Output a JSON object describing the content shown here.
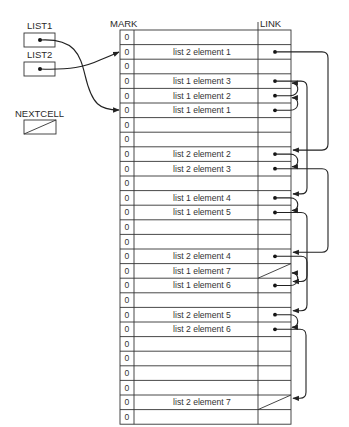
{
  "labels": {
    "list1": "LIST1",
    "list2": "LIST2",
    "nextcell": "NEXTCELL",
    "mark_header": "MARK",
    "link_header": "LINK"
  },
  "table": {
    "x": 120,
    "y": 30,
    "row_height": 14.6,
    "mark_col_right": 134,
    "link_col_left": 258,
    "right": 291,
    "rows": [
      {
        "mark": "0",
        "value": ""
      },
      {
        "mark": "0",
        "value": "list 2 element 1"
      },
      {
        "mark": "0",
        "value": ""
      },
      {
        "mark": "0",
        "value": "list 1 element 3"
      },
      {
        "mark": "0",
        "value": "list 1 element 2"
      },
      {
        "mark": "0",
        "value": "list 1 element 1"
      },
      {
        "mark": "0",
        "value": ""
      },
      {
        "mark": "0",
        "value": ""
      },
      {
        "mark": "0",
        "value": "list 2 element 2"
      },
      {
        "mark": "0",
        "value": "list 2 element 3"
      },
      {
        "mark": "0",
        "value": ""
      },
      {
        "mark": "0",
        "value": "list 1 element 4"
      },
      {
        "mark": "0",
        "value": "list 1 element 5"
      },
      {
        "mark": "0",
        "value": ""
      },
      {
        "mark": "0",
        "value": ""
      },
      {
        "mark": "0",
        "value": "list 2 element 4"
      },
      {
        "mark": "0",
        "value": "list 1 element 7"
      },
      {
        "mark": "0",
        "value": "list 1 element 6"
      },
      {
        "mark": "0",
        "value": ""
      },
      {
        "mark": "0",
        "value": "list 2 element 5"
      },
      {
        "mark": "0",
        "value": "list 2 element 6"
      },
      {
        "mark": "0",
        "value": ""
      },
      {
        "mark": "0",
        "value": ""
      },
      {
        "mark": "0",
        "value": ""
      },
      {
        "mark": "0",
        "value": ""
      },
      {
        "mark": "0",
        "value": "list 2 element 7"
      },
      {
        "mark": "0",
        "value": ""
      }
    ]
  },
  "links": [
    {
      "from": 1,
      "to": 8,
      "style": "loop",
      "x": 328
    },
    {
      "from": 3,
      "to": 11,
      "style": "loop",
      "x": 307
    },
    {
      "from": 4,
      "to": 3,
      "style": "hook"
    },
    {
      "from": 5,
      "to": 4,
      "style": "hook"
    },
    {
      "from": 8,
      "to": 9,
      "style": "hook"
    },
    {
      "from": 9,
      "to": 15,
      "style": "loop",
      "x": 328
    },
    {
      "from": 11,
      "to": 12,
      "style": "hook"
    },
    {
      "from": 12,
      "to": 17,
      "style": "loop",
      "x": 307
    },
    {
      "from": 15,
      "to": 19,
      "style": "loop",
      "x": 307
    },
    {
      "from": 17,
      "to": 16,
      "style": "hook"
    },
    {
      "from": 19,
      "to": 20,
      "style": "hook"
    },
    {
      "from": 20,
      "to": 25,
      "style": "loop",
      "x": 306
    }
  ],
  "nil_rows": [
    16,
    25
  ],
  "pointers": [
    {
      "name": "LIST1",
      "target_row": 5
    },
    {
      "name": "LIST2",
      "target_row": 1
    }
  ],
  "nextcell_value": "nil"
}
